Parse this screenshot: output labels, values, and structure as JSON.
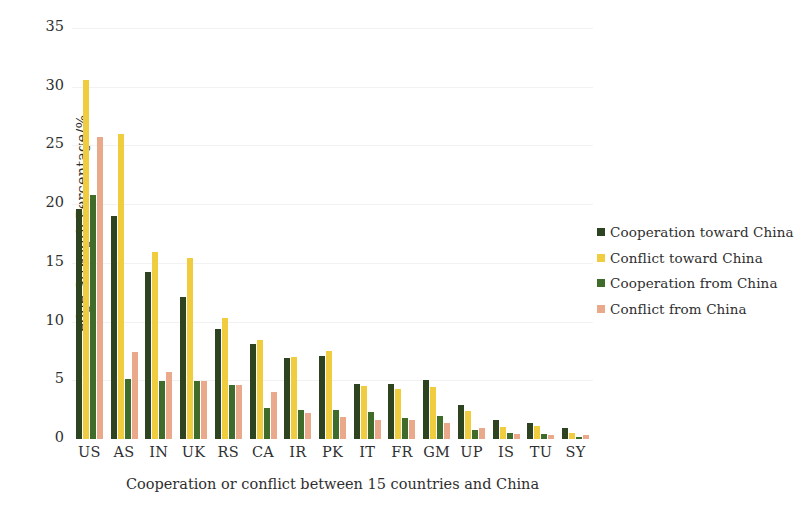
{
  "chart_data": {
    "type": "bar",
    "title": "",
    "xlabel": "Cooperation or conflict between 15 countries and China",
    "ylabel": "edge Strength Percentage/%",
    "ylim": [
      0,
      35
    ],
    "yticks": [
      0,
      5,
      10,
      15,
      20,
      25,
      30,
      35
    ],
    "grid": true,
    "legend_position": "right",
    "categories": [
      "US",
      "AS",
      "IN",
      "UK",
      "RS",
      "CA",
      "IR",
      "PK",
      "IT",
      "FR",
      "GM",
      "UP",
      "IS",
      "TU",
      "SY"
    ],
    "series": [
      {
        "name": "Cooperation toward China",
        "color": "#2e4320",
        "values": [
          19.6,
          19.0,
          14.2,
          12.1,
          9.4,
          8.1,
          6.9,
          7.1,
          4.7,
          4.7,
          5.0,
          2.9,
          1.6,
          1.4,
          0.9
        ]
      },
      {
        "name": "Conflict toward China",
        "color": "#f0cd3f",
        "values": [
          30.6,
          26.0,
          15.9,
          15.4,
          10.3,
          8.4,
          7.0,
          7.5,
          4.5,
          4.3,
          4.4,
          2.4,
          1.0,
          1.1,
          0.5
        ]
      },
      {
        "name": "Cooperation from China",
        "color": "#3f6b2b",
        "values": [
          20.8,
          5.1,
          4.9,
          4.9,
          4.6,
          2.6,
          2.5,
          2.5,
          2.3,
          1.8,
          2.0,
          0.8,
          0.5,
          0.4,
          0.2
        ]
      },
      {
        "name": "Conflict from China",
        "color": "#eaa98a",
        "values": [
          25.7,
          7.4,
          5.7,
          4.9,
          4.6,
          4.0,
          2.2,
          1.9,
          1.6,
          1.6,
          1.4,
          0.9,
          0.4,
          0.3,
          0.3
        ]
      }
    ]
  },
  "axis": {
    "y_title": "edge Strength Percentage/%",
    "x_title": "Cooperation or conflict between 15 countries and China",
    "y_tick_labels": [
      "0",
      "5",
      "10",
      "15",
      "20",
      "25",
      "30",
      "35"
    ],
    "x_tick_labels": [
      "US",
      "AS",
      "IN",
      "UK",
      "RS",
      "CA",
      "IR",
      "PK",
      "IT",
      "FR",
      "GM",
      "UP",
      "IS",
      "TU",
      "SY"
    ]
  },
  "legend": {
    "items": [
      {
        "label": "Cooperation toward China",
        "color": "#2e4320"
      },
      {
        "label": "Conflict toward China",
        "color": "#f0cd3f"
      },
      {
        "label": "Cooperation from China",
        "color": "#3f6b2b"
      },
      {
        "label": "Conflict from China",
        "color": "#eaa98a"
      }
    ]
  }
}
